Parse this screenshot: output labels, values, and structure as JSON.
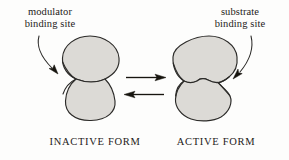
{
  "figure": {
    "background_color": "#fdfdfc",
    "shape_fill_color": "#dcdad6",
    "shape_outline_color": "#2b2a28",
    "text_color": "#1d1b19"
  },
  "callouts": {
    "modulator": {
      "line1": "modulator",
      "line2": "binding site",
      "points_to": "left-shape-waist"
    },
    "substrate": {
      "line1": "substrate",
      "line2": "binding site",
      "points_to": "right-shape-cleft"
    }
  },
  "forms": {
    "inactive": "INACTIVE FORM",
    "active": "ACTIVE FORM"
  },
  "equilibrium": {
    "forward_arrow": "right",
    "reverse_arrow": "left"
  }
}
